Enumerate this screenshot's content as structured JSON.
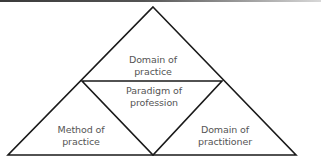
{
  "diagram": {
    "type": "triangle-subdivided",
    "line_color": "#1a1a1a",
    "text_color": "#555555",
    "regions": [
      {
        "id": "top",
        "lines": [
          "Domain of",
          "practice"
        ]
      },
      {
        "id": "center",
        "lines": [
          "Paradigm of",
          "profession"
        ]
      },
      {
        "id": "bottom-left",
        "lines": [
          "Method of",
          "practice"
        ]
      },
      {
        "id": "bottom-right",
        "lines": [
          "Domain of",
          "practitioner"
        ]
      }
    ]
  }
}
